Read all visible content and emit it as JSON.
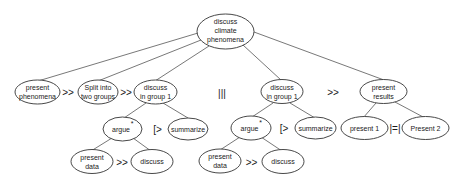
{
  "diagram": {
    "type": "task-tree",
    "colors": {
      "background": "#ffffff",
      "stroke": "#333333",
      "edge": "#555555",
      "text": "#1a1a1a"
    },
    "nodes": {
      "root": {
        "line1": "discuss",
        "line2": "climate",
        "line3": "phenomena"
      },
      "present_phenomena": {
        "line1": "present",
        "line2": "phenomena"
      },
      "split_groups": {
        "line1": "Split into",
        "line2": "two groups"
      },
      "discuss_group1_left": {
        "line1": "discuss",
        "line2": "in group 1"
      },
      "discuss_group1_right": {
        "line1": "discuss",
        "line2": "in group 1"
      },
      "present_results": {
        "line1": "present",
        "line2": "results"
      },
      "argue_left": {
        "label": "argue",
        "marker": "*"
      },
      "summarize_left": {
        "label": "summarize"
      },
      "argue_right": {
        "label": "argue",
        "marker": "*"
      },
      "summarize_right": {
        "label": "summarize"
      },
      "present_1": {
        "label": "present 1"
      },
      "present_2": {
        "label": "Present 2"
      },
      "present_data_left": {
        "line1": "present",
        "line2": "data"
      },
      "discuss_left": {
        "label": "discuss"
      },
      "present_data_right": {
        "line1": "present",
        "line2": "data"
      },
      "discuss_right": {
        "label": "discuss"
      }
    },
    "operators": {
      "enable_1": ">>",
      "enable_2": ">>",
      "concurrent": "|||",
      "enable_3": ">>",
      "disable_left": "[>",
      "disable_right": "[>",
      "order_independent": "|=|",
      "enable_left_leaf": ">>",
      "enable_right_leaf": ">>"
    }
  }
}
